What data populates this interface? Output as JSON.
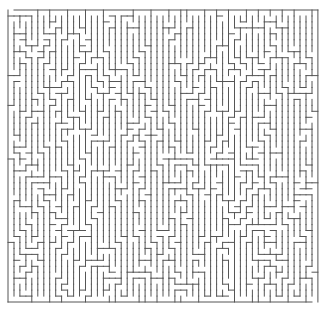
{
  "maze": {
    "origin_x": 8,
    "origin_y": 10,
    "cols": 52,
    "rows": 49,
    "cell": 5.96,
    "wall_color": "#555555",
    "background": "#ffffff",
    "stroke_width": 1,
    "seed": 20240611,
    "entrance": {
      "side": "top",
      "col": 0
    },
    "exit": {
      "side": "bottom",
      "col": 51
    }
  }
}
